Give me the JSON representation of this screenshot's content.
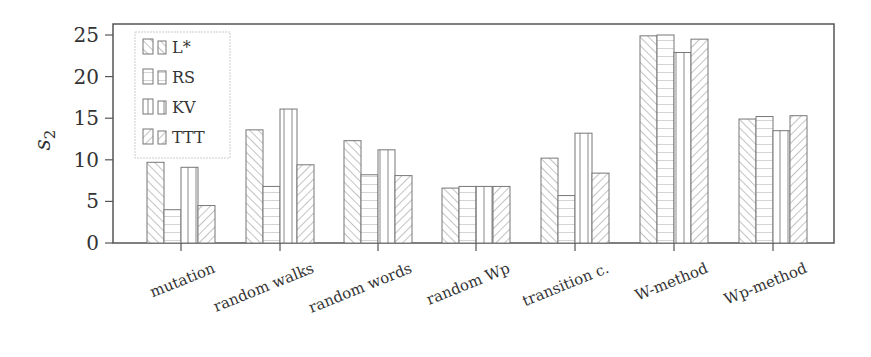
{
  "chart_data": {
    "type": "bar",
    "title": "",
    "xlabel": "",
    "ylabel": "s2",
    "ylim": [
      0,
      25.8
    ],
    "yticks": [
      0,
      5,
      10,
      15,
      20,
      25
    ],
    "grid": false,
    "legend_position": "upper-left",
    "categories": [
      "mutation",
      "random walks",
      "random words",
      "random Wp",
      "transition c.",
      "W-method",
      "Wp-method"
    ],
    "series": [
      {
        "name": "L*",
        "pattern": "diag-back",
        "values": [
          9.7,
          13.6,
          12.3,
          6.6,
          10.2,
          24.9,
          14.9
        ]
      },
      {
        "name": "RS",
        "pattern": "horizontal",
        "values": [
          4.0,
          6.8,
          8.2,
          6.8,
          5.7,
          25.0,
          15.2
        ]
      },
      {
        "name": "KV",
        "pattern": "vertical",
        "values": [
          9.1,
          16.1,
          11.2,
          6.8,
          13.2,
          22.9,
          13.5
        ]
      },
      {
        "name": "TTT",
        "pattern": "diag-fwd",
        "values": [
          4.5,
          9.4,
          8.1,
          6.8,
          8.4,
          24.5,
          15.3
        ]
      }
    ]
  },
  "colors": {
    "stroke": "#555555",
    "hatch": "#8a8a8a",
    "background": "#ffffff"
  }
}
